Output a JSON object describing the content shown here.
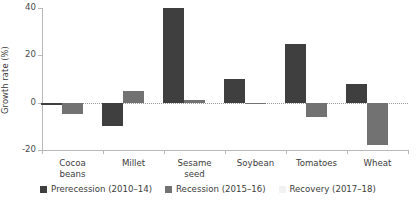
{
  "chart_data": {
    "type": "bar",
    "title": "",
    "subtitle": "",
    "xlabel": "",
    "ylabel": "Growth rate (%)",
    "categories": [
      "Cocoa\nbeans",
      "Millet",
      "Sesame\nseed",
      "Soybean",
      "Tomatoes",
      "Wheat"
    ],
    "series": [
      {
        "name": "Prerecession (2010–14)",
        "color": "#3f3f3f",
        "values": [
          -1,
          -10,
          40,
          10,
          25,
          8
        ]
      },
      {
        "name": "Recession (2015–16)",
        "color": "#727272",
        "values": [
          -5,
          5,
          1,
          -0.5,
          -6,
          -18
        ]
      },
      {
        "name": "Recovery (2017–18)",
        "color": "#f2f2f2",
        "values": [
          0,
          0,
          0,
          0,
          0,
          0
        ]
      }
    ],
    "ylim": [
      -20,
      40
    ],
    "yticks": [
      40,
      20,
      0,
      -20
    ],
    "ytick_labels": [
      "40",
      "20",
      "0",
      "-20"
    ],
    "grid": false,
    "zero_line": true,
    "legend_position": "bottom"
  },
  "legend": {
    "items": [
      {
        "label": "Prerecession (2010–14)",
        "color": "#3f3f3f"
      },
      {
        "label": "Recession (2015–16)",
        "color": "#727272"
      },
      {
        "label": "Recovery (2017–18)",
        "color": "#f2f2f2"
      }
    ]
  }
}
